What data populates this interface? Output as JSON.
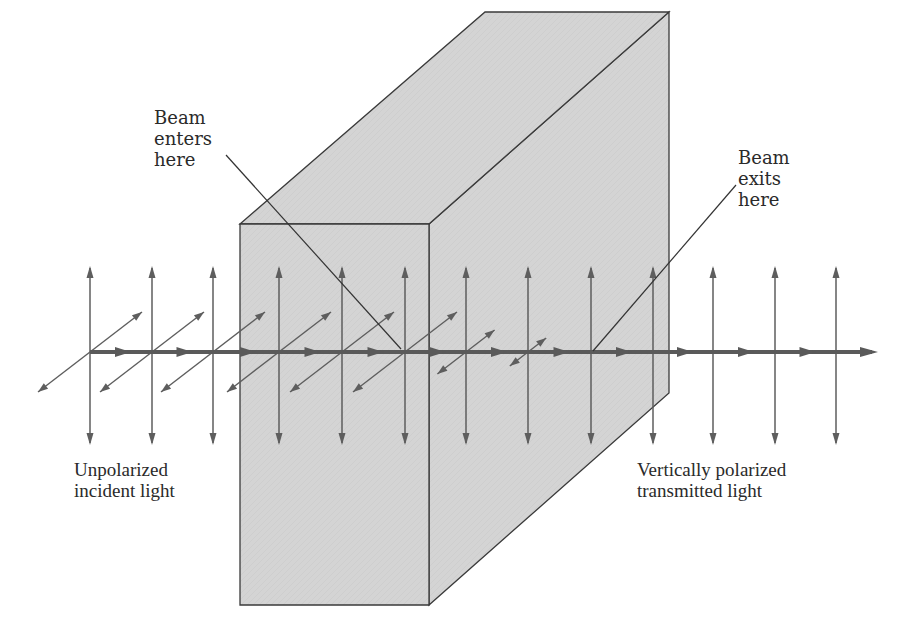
{
  "figure": {
    "colors": {
      "background": "#ffffff",
      "crystal_fill": "#d4d4d4",
      "crystal_edge": "#3a3a3a",
      "beam": "#5a5a5a",
      "arrows": "#5e5e5e",
      "text": "#2a2a2a"
    }
  },
  "labels": {
    "beam_enters": "Beam\nenters\nhere",
    "beam_exits": "Beam\nexits\nhere",
    "unpolarized": "Unpolarized\nincident light",
    "vertically_polarized": "Vertically polarized\ntransmitted light"
  },
  "crystal": {
    "front_face": [
      [
        240,
        224
      ],
      [
        429,
        224
      ],
      [
        429,
        605
      ],
      [
        240,
        605
      ]
    ],
    "top_face": [
      [
        240,
        224
      ],
      [
        485,
        12
      ],
      [
        669,
        12
      ],
      [
        429,
        224
      ]
    ],
    "side_face": [
      [
        429,
        224
      ],
      [
        669,
        12
      ],
      [
        669,
        393
      ],
      [
        429,
        605
      ]
    ]
  },
  "beam": {
    "y": 352,
    "x_start": 90,
    "x_end": 878
  },
  "vertical_arrows_x": [
    90,
    152,
    213,
    279,
    342,
    405,
    466,
    528,
    591,
    653,
    713,
    775,
    836
  ],
  "horizontal_components": [
    {
      "x": 90,
      "scale": 1.0
    },
    {
      "x": 152,
      "scale": 1.0
    },
    {
      "x": 213,
      "scale": 1.0
    },
    {
      "x": 279,
      "scale": 1.0
    },
    {
      "x": 342,
      "scale": 1.0
    },
    {
      "x": 405,
      "scale": 1.0
    },
    {
      "x": 466,
      "scale": 0.55
    },
    {
      "x": 528,
      "scale": 0.35
    }
  ]
}
